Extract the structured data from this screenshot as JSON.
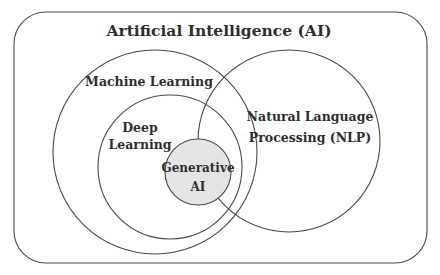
{
  "diagram": {
    "title": "Artificial Intelligence (AI)",
    "colors": {
      "stroke": "#4a4a4a",
      "text": "#2e2e2e",
      "generative_fill": "#e4e4e4",
      "background": "#ffffff"
    },
    "sets": [
      {
        "id": "ml",
        "label_lines": [
          "Machine Learning"
        ]
      },
      {
        "id": "dl",
        "label_lines": [
          "Deep",
          "Learning"
        ]
      },
      {
        "id": "nlp",
        "label_lines": [
          "Natural Language",
          "Processing (NLP)"
        ]
      },
      {
        "id": "genai",
        "label_lines": [
          "Generative",
          "AI"
        ]
      }
    ]
  }
}
